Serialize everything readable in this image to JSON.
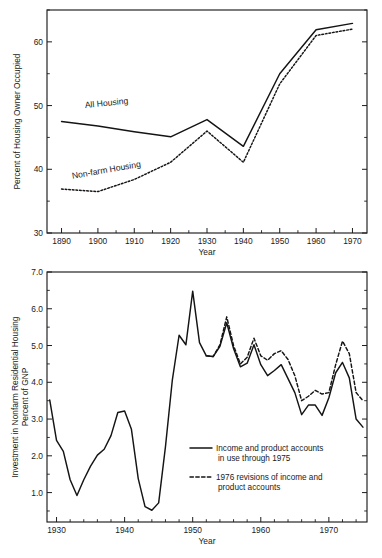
{
  "figure": {
    "background_color": "#ffffff",
    "ink_color": "#141414"
  },
  "chart_data": [
    {
      "id": "housing-owner-occupied",
      "type": "line",
      "title": "",
      "xlabel": "Year",
      "ylabel": "Percent of Housing Owner Occupied",
      "xlim": [
        1886,
        1974
      ],
      "ylim": [
        30,
        65
      ],
      "xticks": [
        1890,
        1900,
        1910,
        1920,
        1930,
        1940,
        1950,
        1960,
        1970
      ],
      "xticklabels": [
        "1890",
        "1900",
        "1910",
        "1920",
        "1930",
        "1940",
        "1950",
        "1960",
        "1970"
      ],
      "xminorticks": [
        1895,
        1905,
        1915,
        1925,
        1935,
        1945,
        1955,
        1965
      ],
      "yticks": [
        30,
        40,
        50,
        60
      ],
      "yticklabels": [
        "30",
        "40",
        "50",
        "60"
      ],
      "yminorticks": [
        35,
        45,
        55,
        65
      ],
      "grid": false,
      "legend_position": "inline-annotations",
      "series": [
        {
          "name": "All Housing",
          "style": "solid",
          "label_text": "All  Housing",
          "label_x": 1896.5,
          "label_y": 49.6,
          "label_rotation": -6,
          "x": [
            1890,
            1900,
            1910,
            1920,
            1930,
            1940,
            1950,
            1960,
            1970
          ],
          "values": [
            47.5,
            46.8,
            45.9,
            45.1,
            47.8,
            43.6,
            55.0,
            61.9,
            62.9
          ]
        },
        {
          "name": "Non-farm Housing",
          "style": "dotted",
          "label_text": "Non-farm  Housing",
          "label_x": 1893.0,
          "label_y": 38.5,
          "label_rotation": -10,
          "x": [
            1890,
            1900,
            1910,
            1920,
            1930,
            1940,
            1950,
            1960,
            1970
          ],
          "values": [
            36.9,
            36.5,
            38.4,
            41.1,
            46.0,
            41.1,
            53.4,
            61.0,
            62.0
          ]
        }
      ]
    },
    {
      "id": "nonfarm-residential-investment",
      "type": "line",
      "title": "",
      "xlabel": "Year",
      "ylabel": "Investment in Nonfarm Residential Housing\nPercent of GNP",
      "ylabel_line1": "Investment in Nonfarm Residential Housing",
      "ylabel_line2": "Percent of GNP",
      "xlim": [
        1928.6,
        1975.6
      ],
      "ylim": [
        0.2,
        7.0
      ],
      "xticks": [
        1930,
        1940,
        1950,
        1960,
        1970
      ],
      "xticklabels": [
        "1930",
        "1940",
        "1950",
        "1960",
        "1970"
      ],
      "xminorticks": [
        1932,
        1934,
        1936,
        1938,
        1942,
        1944,
        1946,
        1948,
        1952,
        1954,
        1956,
        1958,
        1962,
        1964,
        1966,
        1968,
        1972,
        1974
      ],
      "yticks": [
        1.0,
        2.0,
        3.0,
        4.0,
        5.0,
        6.0,
        7.0
      ],
      "yticklabels": [
        "1.0",
        "2.0",
        "3.0",
        "4.0",
        "5.0",
        "6.0",
        "7.0"
      ],
      "yminorticks": [
        0.5,
        1.5,
        2.5,
        3.5,
        4.5,
        5.5,
        6.5
      ],
      "grid": false,
      "legend_position": "lower-right-inside",
      "series": [
        {
          "name": "Income and product accounts in use through 1975",
          "legend_line1": "Income and product accounts",
          "legend_line2": "in use through 1975",
          "style": "solid",
          "x": [
            1929,
            1930,
            1931,
            1932,
            1933,
            1934,
            1935,
            1936,
            1937,
            1938,
            1939,
            1940,
            1941,
            1942,
            1943,
            1944,
            1945,
            1946,
            1947,
            1948,
            1949,
            1950,
            1951,
            1952,
            1953,
            1954,
            1955,
            1956,
            1957,
            1958,
            1959,
            1960,
            1961,
            1962,
            1963,
            1964,
            1965,
            1966,
            1967,
            1968,
            1969,
            1970,
            1971,
            1972,
            1973,
            1974,
            1975
          ],
          "values": [
            3.52,
            2.42,
            2.12,
            1.35,
            0.92,
            1.35,
            1.72,
            2.02,
            2.18,
            2.55,
            3.18,
            3.22,
            2.72,
            1.38,
            0.62,
            0.52,
            0.72,
            2.25,
            4.05,
            5.28,
            5.02,
            6.48,
            5.08,
            4.72,
            4.7,
            4.98,
            5.62,
            4.92,
            4.42,
            4.52,
            5.02,
            4.48,
            4.18,
            4.32,
            4.48,
            4.1,
            3.72,
            3.12,
            3.38,
            3.38,
            3.1,
            3.58,
            4.26,
            4.54,
            4.12,
            3.0,
            2.78
          ]
        },
        {
          "name": "1976 revisions of income and product accounts",
          "legend_line1": "1976 revisions of income and",
          "legend_line2": "product accounts",
          "style": "dashed",
          "x": [
            1952,
            1953,
            1954,
            1955,
            1956,
            1957,
            1958,
            1959,
            1960,
            1961,
            1962,
            1963,
            1964,
            1965,
            1966,
            1967,
            1968,
            1969,
            1970,
            1971,
            1972,
            1973,
            1974,
            1975
          ],
          "values": [
            4.72,
            4.7,
            5.02,
            5.78,
            5.0,
            4.5,
            4.68,
            5.2,
            4.72,
            4.6,
            4.78,
            4.86,
            4.62,
            4.18,
            3.5,
            3.62,
            3.78,
            3.68,
            3.72,
            4.48,
            5.12,
            4.78,
            3.72,
            3.5
          ]
        }
      ]
    }
  ]
}
